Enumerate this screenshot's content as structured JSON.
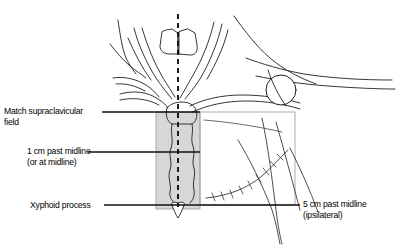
{
  "figure": {
    "view": "anterior chest and neck, line drawing"
  },
  "labels": {
    "match_supraclavicular": {
      "line1": "Match supraclavicular",
      "line2": "field"
    },
    "one_cm_past_midline": {
      "line1": "1 cm past midline",
      "line2": "(or at midline)"
    },
    "xyphoid_process": {
      "line1": "Xyphoid process"
    },
    "five_cm_past_midline": {
      "line1": "5 cm past midline",
      "line2": "(ipsilateral)"
    }
  },
  "anatomy": [
    {
      "name": "larynx-thyroid-cartilage"
    },
    {
      "name": "sternocleidomastoid-muscle-left"
    },
    {
      "name": "sternocleidomastoid-muscle-right"
    },
    {
      "name": "clavicle-left"
    },
    {
      "name": "clavicle-right"
    },
    {
      "name": "humeral-head"
    },
    {
      "name": "sternum-manubrium"
    },
    {
      "name": "xyphoid-process"
    },
    {
      "name": "mastectomy-scar"
    },
    {
      "name": "breast-contour"
    }
  ],
  "markings": {
    "midline": {
      "name": "midline-dashed-line",
      "style": "dashed"
    },
    "medial_field": {
      "name": "medial-tangent-field",
      "fill": "#d8d8d8"
    },
    "lateral_field": {
      "name": "lateral-tangent-field",
      "stroke": "#9a9a9a"
    }
  },
  "colors": {
    "ink": "#1a1a1a",
    "light_ink": "#6e6e6e",
    "field_fill": "#d7d7d7",
    "field_stroke": "#8f8f8f",
    "background": "#ffffff"
  }
}
